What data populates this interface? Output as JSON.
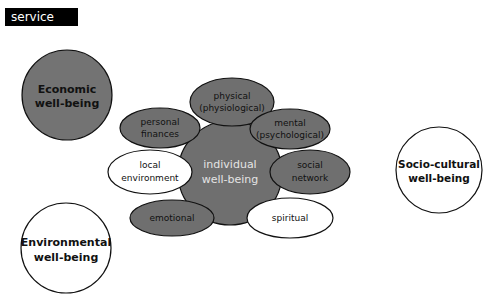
{
  "header": {
    "tag_label": "service"
  },
  "colors": {
    "gray_fill": "#6f6f6f",
    "outer_gray_fill": "#737373",
    "white_fill": "#ffffff",
    "stroke": "#111111",
    "center_text": "#e4e4e4"
  },
  "outer_domains": [
    {
      "id": "economic",
      "lines": [
        "Economic",
        "well-being"
      ],
      "fill": "gray"
    },
    {
      "id": "socio-cultural",
      "lines": [
        "Socio-cultural",
        "well-being"
      ],
      "fill": "white"
    },
    {
      "id": "environmental",
      "lines": [
        "Environmental",
        "well-being"
      ],
      "fill": "white"
    }
  ],
  "center": {
    "lines": [
      "individual",
      "well-being"
    ]
  },
  "satellites": [
    {
      "id": "physical",
      "lines": [
        "physical",
        "(physiological)"
      ],
      "fill": "gray"
    },
    {
      "id": "personal-finances",
      "lines": [
        "personal",
        "finances"
      ],
      "fill": "gray"
    },
    {
      "id": "mental",
      "lines": [
        "mental",
        "(psychological)"
      ],
      "fill": "gray"
    },
    {
      "id": "local-environment",
      "lines": [
        "local",
        "environment"
      ],
      "fill": "white"
    },
    {
      "id": "social-network",
      "lines": [
        "social",
        "network"
      ],
      "fill": "gray"
    },
    {
      "id": "emotional",
      "lines": [
        "emotional"
      ],
      "fill": "gray"
    },
    {
      "id": "spiritual",
      "lines": [
        "spiritual"
      ],
      "fill": "white"
    }
  ]
}
